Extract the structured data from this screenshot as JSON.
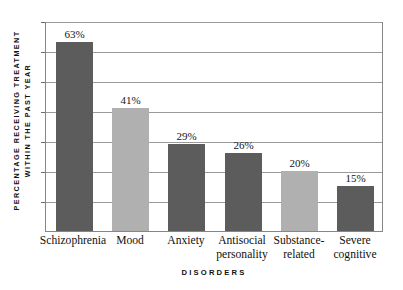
{
  "chart_data": {
    "type": "bar",
    "title": "",
    "subtitle": "",
    "xlabel": "DISORDERS",
    "ylabel_line1": "PERCENTAGE RECEIVING TREATMENT",
    "ylabel_line2": "WITHIN THE PAST YEAR",
    "categories": [
      "Schizophrenia",
      "Mood",
      "Anxiety",
      "Antisocial\npersonality",
      "Substance-\nrelated",
      "Severe\ncognitive"
    ],
    "values": [
      63,
      41,
      29,
      26,
      20,
      15
    ],
    "data_labels": [
      "63%",
      "41%",
      "29%",
      "26%",
      "20%",
      "15%"
    ],
    "bar_colors": [
      "#5c5c5c",
      "#b0b0b0",
      "#5c5c5c",
      "#5c5c5c",
      "#b0b0b0",
      "#5c5c5c"
    ],
    "ylim": [
      0,
      70
    ],
    "ytick_values": [
      0,
      10,
      20,
      30,
      40,
      50,
      60,
      70
    ],
    "ytick_labels": [
      "",
      "",
      "",
      "",
      "",
      "",
      "",
      ""
    ],
    "grid": true,
    "grid_axis": "y",
    "grid_color": "#9a9a9a",
    "legend": false,
    "legend_position": "none",
    "plot_border_color": "#868686",
    "background_color": "#ffffff",
    "text_color": "#111111"
  },
  "axes": {
    "y_title_line1": "PERCENTAGE RECEIVING TREATMENT",
    "y_title_line2": "WITHIN THE PAST YEAR",
    "x_title": "DISORDERS"
  },
  "bars": [
    {
      "category": "Schizophrenia",
      "label": "Schizophrenia",
      "value": 63,
      "value_label": "63%",
      "color": "#5c5c5c"
    },
    {
      "category": "Mood",
      "label": "Mood",
      "value": 41,
      "value_label": "41%",
      "color": "#b0b0b0"
    },
    {
      "category": "Anxiety",
      "label": "Anxiety",
      "value": 29,
      "value_label": "29%",
      "color": "#5c5c5c"
    },
    {
      "category": "Antisocial personality",
      "label": "Antisocial\npersonality",
      "value": 26,
      "value_label": "26%",
      "color": "#5c5c5c"
    },
    {
      "category": "Substance-related",
      "label": "Substance-\nrelated",
      "value": 20,
      "value_label": "20%",
      "color": "#b0b0b0"
    },
    {
      "category": "Severe cognitive",
      "label": "Severe\ncognitive",
      "value": 15,
      "value_label": "15%",
      "color": "#5c5c5c"
    }
  ]
}
